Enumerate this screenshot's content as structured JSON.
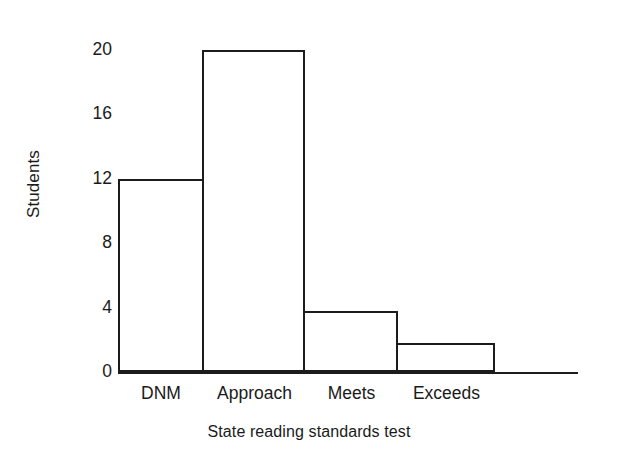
{
  "chart_data": {
    "type": "bar",
    "title": "",
    "subtitle": "",
    "xlabel": "State reading standards test",
    "ylabel": "Students",
    "categories": [
      "DNM",
      "Approach",
      "Meets",
      "Exceeds"
    ],
    "values": [
      12,
      20,
      3.8,
      1.8
    ],
    "ylim": [
      0,
      20
    ],
    "yticks": [
      0,
      4,
      8,
      12,
      16,
      20
    ],
    "ytick_labels": [
      "0",
      "4",
      "8",
      "12",
      "16",
      "20"
    ],
    "xlim": [
      0,
      4
    ],
    "grid": false,
    "legend": null,
    "annotations": [],
    "style": {
      "bar_fill": "#ffffff",
      "bar_edge": "#1c1c1c",
      "bar_edge_width": 2.5,
      "axis_color": "#1c1c1c",
      "text_color": "#1a1a1a",
      "background": "#ffffff",
      "bars_touch": true,
      "spines": "bottom-only"
    },
    "geometry": {
      "plot_left_px": 118,
      "plot_baseline_px": 372,
      "plot_top_px": 50,
      "axis_right_px": 578,
      "bar_edges_px": [
        118,
        204,
        305,
        398,
        495
      ],
      "ytick_y_px": [
        372,
        307,
        245,
        180,
        115,
        50
      ]
    }
  }
}
